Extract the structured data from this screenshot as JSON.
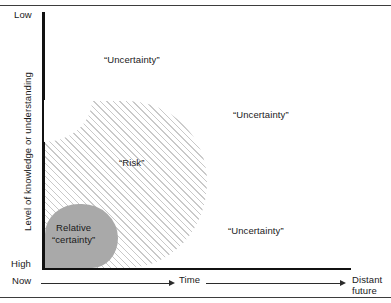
{
  "figure": {
    "axes": {
      "y_title": "Level of knowledge or understanding",
      "y_top_label": "Low",
      "y_bottom_label": "High",
      "x_start_label": "Now",
      "x_mid_label": "Time",
      "x_end_label_line1": "Distant",
      "x_end_label_line2": "future"
    },
    "regions": [
      {
        "id": "uncertainty-top-left",
        "label": "“Uncertainty”"
      },
      {
        "id": "uncertainty-right-upper",
        "label": "“Uncertainty”"
      },
      {
        "id": "uncertainty-right-lower",
        "label": "“Uncertainty”"
      },
      {
        "id": "risk",
        "label": "“Risk”"
      },
      {
        "id": "relative-certainty",
        "label_line1": "Relative",
        "label_line2": "“certainty”"
      }
    ],
    "colors": {
      "certainty_fill": "#a9a9a9",
      "risk_hatch": "#c9c9c9",
      "axis": "#111111",
      "rule": "#3d3d3d",
      "text": "#1a1a1a",
      "background": "#ffffff"
    }
  },
  "chart_data": {
    "type": "area",
    "title": "",
    "xlabel": "Time",
    "ylabel": "Level of knowledge or understanding",
    "x_axis": {
      "ticks": [
        "Now",
        "Time",
        "Distant future"
      ],
      "direction": "left-to-right, increasing time"
    },
    "y_axis": {
      "ticks": [
        "Low",
        "High"
      ],
      "note": "Axis is inverted: 'Low' at top, 'High' at bottom"
    },
    "grid": false,
    "legend": "none",
    "series": [
      {
        "name": "Relative “certainty”",
        "style": "solid gray fill",
        "description": "Small rounded region anchored at the bottom-left corner (Now / High knowledge)"
      },
      {
        "name": "“Risk”",
        "style": "diagonal hatch fill",
        "description": "Large rounded region spanning from the y-axis to roughly the mid-point of the time axis, bounded below by the x-axis"
      },
      {
        "name": "“Uncertainty”",
        "style": "unshaded white background",
        "description": "All remaining area outside the hatched and gray regions; labeled in three places"
      }
    ]
  }
}
